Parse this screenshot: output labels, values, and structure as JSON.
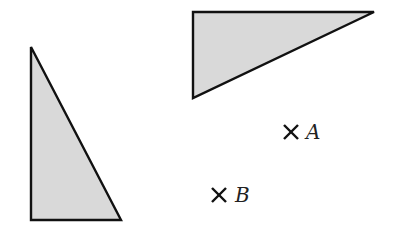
{
  "diagram": {
    "shapes": [
      {
        "id": "left-triangle",
        "kind": "right-triangle",
        "fill": "#d9d9d9",
        "stroke": "#111111"
      },
      {
        "id": "top-triangle",
        "kind": "right-triangle",
        "fill": "#d9d9d9",
        "stroke": "#111111"
      }
    ],
    "points": [
      {
        "label": "A",
        "marker": "cross"
      },
      {
        "label": "B",
        "marker": "cross"
      }
    ]
  }
}
